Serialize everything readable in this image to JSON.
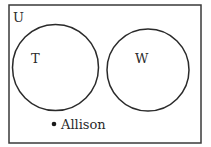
{
  "diagram": {
    "type": "venn",
    "universe_label": "U",
    "sets": [
      {
        "label": "T"
      },
      {
        "label": "W"
      }
    ],
    "element": {
      "label": "Allison",
      "region": "outside both sets"
    },
    "colors": {
      "stroke": "#2a2a2a",
      "background": "#ffffff"
    }
  }
}
